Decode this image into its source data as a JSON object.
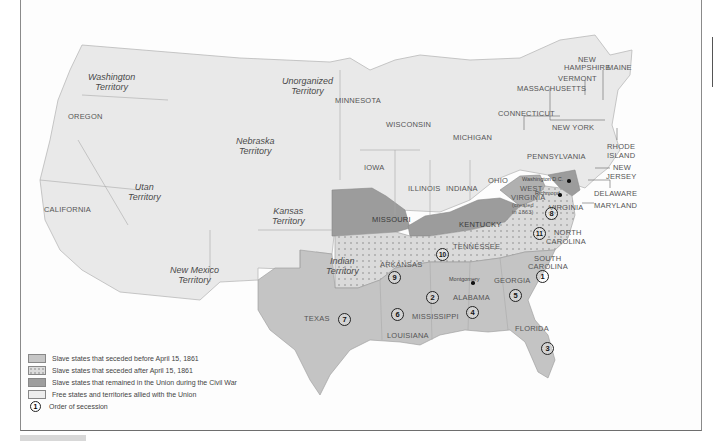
{
  "map": {
    "type": "historical-map",
    "subject": "United States during the Civil War — secession",
    "territories": [
      {
        "name": "Washington Territory",
        "x": 88,
        "y": 72
      },
      {
        "name": "Unorganized Territory",
        "x": 282,
        "y": 78
      },
      {
        "name": "Nebraska Territory",
        "x": 236,
        "y": 134
      },
      {
        "name": "Utan Territory",
        "x": 138,
        "y": 180
      },
      {
        "name": "Kansas Territory",
        "x": 272,
        "y": 208
      },
      {
        "name": "Indian Territory",
        "x": 338,
        "y": 258
      },
      {
        "name": "New Mexico Territory",
        "x": 193,
        "y": 263
      }
    ],
    "states": [
      {
        "name": "OREGON",
        "x": 68,
        "y": 112
      },
      {
        "name": "CALIFORNIA",
        "x": 44,
        "y": 205
      },
      {
        "name": "MINNESOTA",
        "x": 335,
        "y": 96
      },
      {
        "name": "WISCONSIN",
        "x": 386,
        "y": 120
      },
      {
        "name": "MICHIGAN",
        "x": 453,
        "y": 133
      },
      {
        "name": "IOWA",
        "x": 364,
        "y": 163
      },
      {
        "name": "ILLINOIS",
        "x": 408,
        "y": 184
      },
      {
        "name": "INDIANA",
        "x": 446,
        "y": 184
      },
      {
        "name": "OHIO",
        "x": 488,
        "y": 176
      },
      {
        "name": "PENNSYLVANIA",
        "x": 527,
        "y": 152
      },
      {
        "name": "NEW YORK",
        "x": 552,
        "y": 123
      },
      {
        "name": "CONNECTICUT",
        "x": 498,
        "y": 109
      },
      {
        "name": "MASSACHUSETTS",
        "x": 517,
        "y": 84
      },
      {
        "name": "VERMONT",
        "x": 558,
        "y": 74
      },
      {
        "name": "NEW",
        "x": 578,
        "y": 55
      },
      {
        "name": "HAMPSHIRE",
        "x": 564,
        "y": 63
      },
      {
        "name": "MAINE",
        "x": 607,
        "y": 63
      },
      {
        "name": "RHODE",
        "x": 607,
        "y": 142
      },
      {
        "name": "ISLAND",
        "x": 607,
        "y": 151
      },
      {
        "name": "NEW",
        "x": 613,
        "y": 163
      },
      {
        "name": "JERSEY",
        "x": 606,
        "y": 172
      },
      {
        "name": "DELAWARE",
        "x": 594,
        "y": 189
      },
      {
        "name": "MARYLAND",
        "x": 594,
        "y": 201
      },
      {
        "name": "MISSOURI",
        "x": 372,
        "y": 215
      },
      {
        "name": "KENTUCKY",
        "x": 459,
        "y": 220
      },
      {
        "name": "WEST",
        "x": 520,
        "y": 184
      },
      {
        "name": "VIRGINIA",
        "x": 511,
        "y": 193
      },
      {
        "name": "(created",
        "x": 512,
        "y": 201
      },
      {
        "name": "in 1863)",
        "x": 512,
        "y": 208
      },
      {
        "name": "VIRGINIA",
        "x": 549,
        "y": 203
      },
      {
        "name": "NORTH",
        "x": 554,
        "y": 228
      },
      {
        "name": "CAROLINA",
        "x": 546,
        "y": 237
      },
      {
        "name": "TENNESSEE",
        "x": 453,
        "y": 242
      },
      {
        "name": "ARKANSAS",
        "x": 380,
        "y": 260
      },
      {
        "name": "SOUTH",
        "x": 534,
        "y": 254
      },
      {
        "name": "CAROLINA",
        "x": 528,
        "y": 262
      },
      {
        "name": "GEORGIA",
        "x": 494,
        "y": 276
      },
      {
        "name": "ALABAMA",
        "x": 453,
        "y": 293
      },
      {
        "name": "MISSISSIPPI",
        "x": 412,
        "y": 312
      },
      {
        "name": "TEXAS",
        "x": 304,
        "y": 314
      },
      {
        "name": "LOUISIANA",
        "x": 387,
        "y": 331
      },
      {
        "name": "FLORIDA",
        "x": 515,
        "y": 324
      }
    ],
    "cities": [
      {
        "name": "Washington D.C.",
        "x": 522,
        "y": 178,
        "dot_x": 567,
        "dot_y": 180
      },
      {
        "name": "Richmond",
        "x": 547,
        "y": 191,
        "dot_x": 558,
        "dot_y": 193
      },
      {
        "name": "Montgomery",
        "x": 449,
        "y": 277,
        "dot_x": 471,
        "dot_y": 280
      }
    ],
    "secession_order": [
      {
        "n": "1",
        "state": "South Carolina",
        "x": 536,
        "y": 270
      },
      {
        "n": "2",
        "state": "Mississippi",
        "x": 426,
        "y": 291
      },
      {
        "n": "3",
        "state": "Florida",
        "x": 541,
        "y": 342
      },
      {
        "n": "4",
        "state": "Alabama",
        "x": 466,
        "y": 306
      },
      {
        "name": "Georgia",
        "n": "5",
        "x": 509,
        "y": 289
      },
      {
        "n": "6",
        "state": "Louisiana",
        "x": 391,
        "y": 308
      },
      {
        "n": "7",
        "state": "Texas",
        "x": 338,
        "y": 313
      },
      {
        "n": "8",
        "state": "Virginia",
        "x": 545,
        "y": 213
      },
      {
        "n": "9",
        "state": "Arkansas",
        "x": 388,
        "y": 273
      },
      {
        "n": "10",
        "state": "Tennessee",
        "x": 438,
        "y": 250
      },
      {
        "n": "11",
        "state": "North Carolina",
        "x": 535,
        "y": 229
      }
    ]
  },
  "legend": {
    "items": [
      {
        "label": "Slave states that seceded before April 15, 1861",
        "swatch": "#c6c6c6",
        "pattern": "solid"
      },
      {
        "label": "Slave states that seceded after April 15, 1861",
        "swatch": "#dcdcdc",
        "pattern": "dotted"
      },
      {
        "label": "Slave states that remained in the Union during the Civil War",
        "swatch": "#9e9e9e",
        "pattern": "solid"
      },
      {
        "label": "Free states and territories allied with the Union",
        "swatch": "#eeeeee",
        "pattern": "solid"
      },
      {
        "label": "Order of secession",
        "symbol": "1"
      }
    ]
  },
  "colors": {
    "seceded_before": "#c4c4c4",
    "seceded_after": "#dadada",
    "border_states": "#9c9c9c",
    "free_states": "#e9e9e9",
    "water": "#fdfdfd"
  }
}
